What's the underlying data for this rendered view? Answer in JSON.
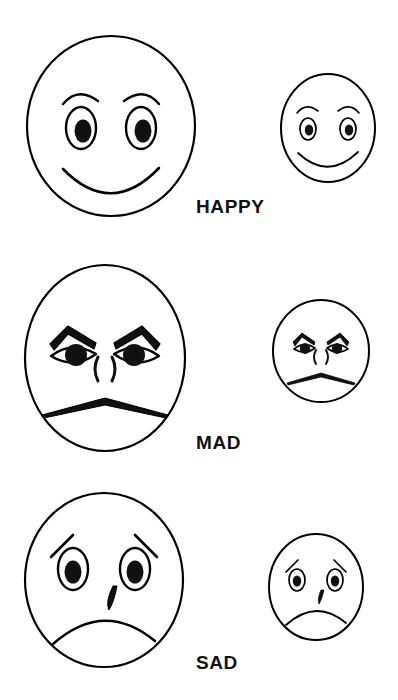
{
  "page": {
    "background_color": "#ffffff",
    "ink_color": "#000000",
    "width": 398,
    "height": 700
  },
  "rows": [
    {
      "id": "happy",
      "label": "HAPPY",
      "label_x": 196,
      "label_y": 196,
      "large_face": {
        "name": "large-happy-face",
        "x": 20,
        "y": 28,
        "w": 182,
        "h": 196,
        "cx": 91,
        "cy": 98,
        "rx": 84,
        "ry": 90,
        "mouth": "smile",
        "brows": "arched",
        "eyes": "oval-pupil",
        "nose": "none",
        "tear": false
      },
      "small_face": {
        "name": "small-happy-face",
        "x": 276,
        "y": 68,
        "w": 104,
        "h": 120,
        "cx": 52,
        "cy": 60,
        "rx": 47,
        "ry": 54,
        "mouth": "smile",
        "brows": "arched",
        "eyes": "oval-pupil",
        "nose": "none",
        "tear": false
      }
    },
    {
      "id": "mad",
      "label": "MAD",
      "label_x": 196,
      "label_y": 432,
      "large_face": {
        "name": "large-mad-face",
        "x": 18,
        "y": 258,
        "w": 174,
        "h": 200,
        "cx": 87,
        "cy": 100,
        "rx": 80,
        "ry": 93,
        "mouth": "angry-flat",
        "brows": "angled-angry",
        "eyes": "almond-pupil",
        "nose": "bracket-pair",
        "tear": false
      },
      "small_face": {
        "name": "small-mad-face",
        "x": 269,
        "y": 295,
        "w": 105,
        "h": 112,
        "cx": 52,
        "cy": 56,
        "rx": 48,
        "ry": 51,
        "mouth": "angry-flat",
        "brows": "angled-angry",
        "eyes": "almond-pupil",
        "nose": "bracket-pair",
        "tear": false
      }
    },
    {
      "id": "sad",
      "label": "SAD",
      "label_x": 196,
      "label_y": 652,
      "large_face": {
        "name": "large-sad-face",
        "x": 18,
        "y": 486,
        "w": 172,
        "h": 188,
        "cx": 86,
        "cy": 94,
        "rx": 79,
        "ry": 87,
        "mouth": "frown",
        "brows": "slanted-lines",
        "eyes": "oval-pupil",
        "nose": "none",
        "tear": true
      },
      "small_face": {
        "name": "small-sad-face",
        "x": 264,
        "y": 528,
        "w": 104,
        "h": 118,
        "cx": 52,
        "cy": 59,
        "rx": 47,
        "ry": 53,
        "mouth": "frown",
        "brows": "slanted-lines",
        "eyes": "oval-pupil",
        "nose": "none",
        "tear": true
      }
    }
  ]
}
